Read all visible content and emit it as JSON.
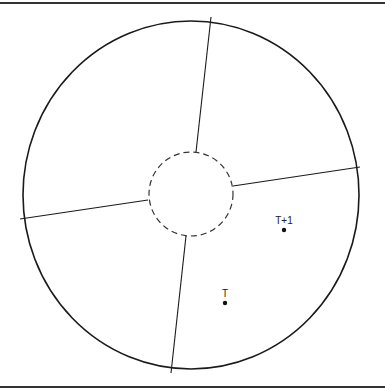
{
  "diagram": {
    "points": [
      {
        "id": "t",
        "label": "T"
      },
      {
        "id": "t-plus-1",
        "label": "T+1"
      }
    ],
    "colors": {
      "stroke": "#1a1a1a",
      "background": "#ffffff"
    }
  }
}
